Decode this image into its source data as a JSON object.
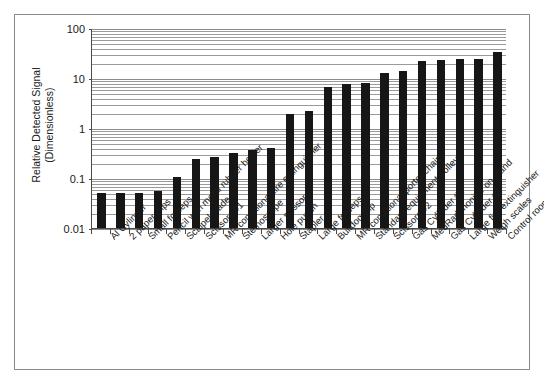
{
  "chart": {
    "ylabel_line1": "Relative Detected Signal",
    "ylabel_line2": "(Dimensionless)",
    "ytick_labels": [
      "100",
      "10",
      "1",
      "0.1",
      "0.01"
    ]
  },
  "chart_data": {
    "type": "bar",
    "title": "",
    "xlabel": "",
    "ylabel": "Relative Detected Signal (Dimensionless)",
    "yscale": "log",
    "ylim": [
      0.01,
      100
    ],
    "yticks": [
      0.01,
      0.1,
      1,
      10,
      100
    ],
    "ytick_labels": [
      "0.01",
      "0.1",
      "1",
      "10",
      "100"
    ],
    "grid": true,
    "grid_minor": true,
    "legend": false,
    "bar_color": "#161616",
    "categories": [
      "Al Cylinder",
      "2 paper clips",
      "Small forceps",
      "Pencil with metal rubber holder",
      "Scalpel blade",
      "Scissors #1",
      "MR conditional fire extinguisher",
      "Stethoscope",
      "Larger scissors",
      "Hole punch",
      "Stapler",
      "Large forceps",
      "Bulldog clip",
      "MR conditional porter chair",
      "Standard equipment trolley",
      "Scissors #2",
      "Gas Cylinder #1",
      "MedRad monitor on stand",
      "Gas Cylinder #2",
      "Large fire extinguisher",
      "Weigh scales",
      "Control room chair"
    ],
    "values": [
      0.05,
      0.05,
      0.05,
      0.055,
      0.105,
      0.24,
      0.26,
      0.32,
      0.37,
      0.4,
      1.95,
      2.2,
      6.5,
      7.6,
      8.0,
      12.5,
      14.0,
      22.0,
      23.0,
      23.5,
      24.5,
      33.0
    ]
  }
}
